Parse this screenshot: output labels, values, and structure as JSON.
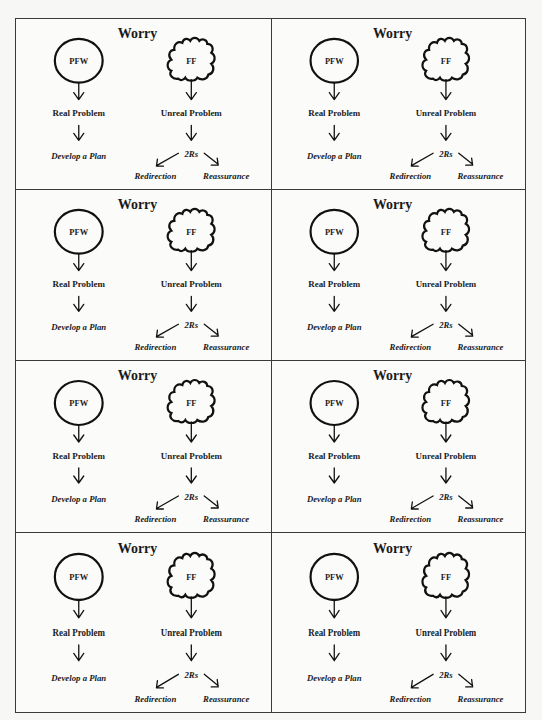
{
  "document": {
    "layout": {
      "rows": 4,
      "columns": 2
    },
    "cells": [
      {
        "title": "Worry",
        "pfw": "PFW",
        "ff": "FF",
        "real_problem": "Real Problem",
        "unreal_problem": "Unreal Problem",
        "develop_plan": "Develop a Plan",
        "two_rs": "2Rs",
        "redirection": "Redirection",
        "reassurance": "Reassurance"
      },
      {
        "title": "Worry",
        "pfw": "PFW",
        "ff": "FF",
        "real_problem": "Real Problem",
        "unreal_problem": "Unreal Problem",
        "develop_plan": "Develop a Plan",
        "two_rs": "2Rs",
        "redirection": "Redirection",
        "reassurance": "Reassurance"
      },
      {
        "title": "Worry",
        "pfw": "PFW",
        "ff": "FF",
        "real_problem": "Real Problem",
        "unreal_problem": "Unreal Problem",
        "develop_plan": "Develop a Plan",
        "two_rs": "2Rs",
        "redirection": "Redirection",
        "reassurance": "Reassurance"
      },
      {
        "title": "Worry",
        "pfw": "PFW",
        "ff": "FF",
        "real_problem": "Real Problem",
        "unreal_problem": "Unreal Problem",
        "develop_plan": "Develop a Plan",
        "two_rs": "2Rs",
        "redirection": "Redirection",
        "reassurance": "Reassurance"
      },
      {
        "title": "Worry",
        "pfw": "PFW",
        "ff": "FF",
        "real_problem": "Real Problem",
        "unreal_problem": "Unreal Problem",
        "develop_plan": "Develop a Plan",
        "two_rs": "2Rs",
        "redirection": "Redirection",
        "reassurance": "Reassurance"
      },
      {
        "title": "Worry",
        "pfw": "PFW",
        "ff": "FF",
        "real_problem": "Real Problem",
        "unreal_problem": "Unreal Problem",
        "develop_plan": "Develop a Plan",
        "two_rs": "2Rs",
        "redirection": "Redirection",
        "reassurance": "Reassurance"
      },
      {
        "title": "Worry",
        "pfw": "PFW",
        "ff": "FF",
        "real_problem": "Real Problem",
        "unreal_problem": "Unreal Problem",
        "develop_plan": "Develop a Plan",
        "two_rs": "2Rs",
        "redirection": "Redirection",
        "reassurance": "Reassurance"
      },
      {
        "title": "Worry",
        "pfw": "PFW",
        "ff": "FF",
        "real_problem": "Real Problem",
        "unreal_problem": "Unreal Problem",
        "develop_plan": "Develop a Plan",
        "two_rs": "2Rs",
        "redirection": "Redirection",
        "reassurance": "Reassurance"
      }
    ],
    "icons": {
      "pfw_shape": "circle-outline",
      "ff_shape": "cloud-outline",
      "arrows": [
        "arrow-down",
        "arrow-down-left",
        "arrow-down-right"
      ]
    },
    "colors": {
      "ink": "#111111",
      "paper": "#f7f7f5",
      "border": "#3a3a3a"
    }
  }
}
